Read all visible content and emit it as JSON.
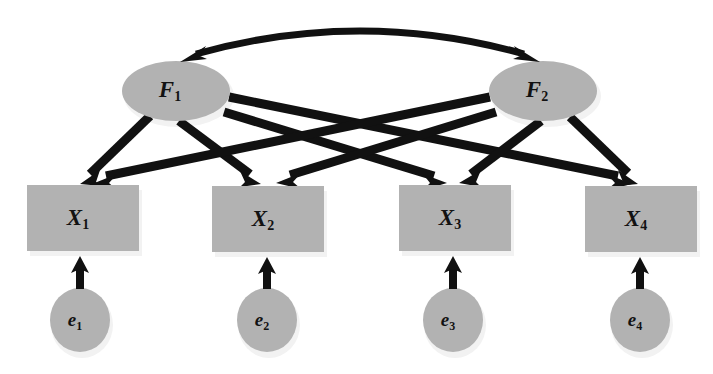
{
  "diagram": {
    "type": "sem-path-diagram",
    "background_color": "#ffffff",
    "shape_fill_color": "#b2b2b2",
    "shape_shadow_color": "#f2f2f2",
    "path_color": "#111111"
  },
  "latent_factors": [
    {
      "id": "F1",
      "label": "F",
      "subscript": "1",
      "shape": "ellipse",
      "cx": 176,
      "cy": 91,
      "rx": 54,
      "ry": 30
    },
    {
      "id": "F2",
      "label": "F",
      "subscript": "2",
      "shape": "ellipse",
      "cx": 543,
      "cy": 91,
      "rx": 54,
      "ry": 30
    }
  ],
  "indicators": [
    {
      "id": "X1",
      "label": "X",
      "subscript": "1",
      "shape": "rect",
      "x": 27,
      "y": 185,
      "width": 112,
      "height": 66
    },
    {
      "id": "X2",
      "label": "X",
      "subscript": "2",
      "shape": "rect",
      "x": 212,
      "y": 186,
      "width": 112,
      "height": 66
    },
    {
      "id": "X3",
      "label": "X",
      "subscript": "3",
      "shape": "rect",
      "x": 399,
      "y": 185,
      "width": 112,
      "height": 66
    },
    {
      "id": "X4",
      "label": "X",
      "subscript": "4",
      "shape": "rect",
      "x": 585,
      "y": 186,
      "width": 112,
      "height": 66
    }
  ],
  "errors": [
    {
      "id": "e1",
      "label": "e",
      "subscript": "1",
      "shape": "ellipse",
      "cx": 80,
      "cy": 320,
      "rx": 30,
      "ry": 32
    },
    {
      "id": "e2",
      "label": "e",
      "subscript": "2",
      "shape": "ellipse",
      "cx": 267,
      "cy": 320,
      "rx": 30,
      "ry": 32
    },
    {
      "id": "e3",
      "label": "e",
      "subscript": "3",
      "shape": "ellipse",
      "cx": 453,
      "cy": 320,
      "rx": 30,
      "ry": 32
    },
    {
      "id": "e4",
      "label": "e",
      "subscript": "4",
      "shape": "ellipse",
      "cx": 640,
      "cy": 320,
      "rx": 30,
      "ry": 32
    }
  ],
  "loading_paths": [
    {
      "id": "F1-X1",
      "from": "F1",
      "to": "X1",
      "x1": 149,
      "y1": 117,
      "x2": 82,
      "y2": 180,
      "head_angle_deg": 137
    },
    {
      "id": "F1-X2",
      "from": "F1",
      "to": "X2",
      "x1": 178,
      "y1": 121,
      "x2": 258,
      "y2": 181,
      "head_angle_deg": 37
    },
    {
      "id": "F1-X3",
      "from": "F1",
      "to": "X3",
      "x1": 223,
      "y1": 111,
      "x2": 443,
      "y2": 180,
      "head_angle_deg": 17
    },
    {
      "id": "F1-X4",
      "from": "F1",
      "to": "X4",
      "x1": 229,
      "y1": 96,
      "x2": 628,
      "y2": 181,
      "head_angle_deg": 12
    },
    {
      "id": "F2-X1",
      "from": "F2",
      "to": "X1",
      "x1": 490,
      "y1": 96,
      "x2": 95,
      "y2": 181,
      "head_angle_deg": 168
    },
    {
      "id": "F2-X2",
      "from": "F2",
      "to": "X2",
      "x1": 496,
      "y1": 111,
      "x2": 278,
      "y2": 180,
      "head_angle_deg": 163
    },
    {
      "id": "F2-X3",
      "from": "F2",
      "to": "X3",
      "x1": 541,
      "y1": 121,
      "x2": 461,
      "y2": 181,
      "head_angle_deg": 143
    },
    {
      "id": "F2-X4",
      "from": "F2",
      "to": "X4",
      "x1": 570,
      "y1": 117,
      "x2": 636,
      "y2": 180,
      "head_angle_deg": 43
    }
  ],
  "error_paths": [
    {
      "id": "e1-X1",
      "from": "e1",
      "to": "X1",
      "x1": 80,
      "y1": 288,
      "x2": 80,
      "y2": 258
    },
    {
      "id": "e2-X2",
      "from": "e2",
      "to": "X2",
      "x1": 267,
      "y1": 288,
      "x2": 267,
      "y2": 258
    },
    {
      "id": "e3-X3",
      "from": "e3",
      "to": "X3",
      "x1": 453,
      "y1": 288,
      "x2": 453,
      "y2": 258
    },
    {
      "id": "e4-X4",
      "from": "e4",
      "to": "X4",
      "x1": 640,
      "y1": 288,
      "x2": 640,
      "y2": 258
    }
  ],
  "covariance_path": {
    "id": "F1-F2-covariance",
    "from": "F1",
    "to": "F2",
    "double_headed": true,
    "start_x": 192,
    "start_y": 58,
    "end_x": 528,
    "end_y": 58,
    "control_x": 360,
    "control_y": 10
  }
}
